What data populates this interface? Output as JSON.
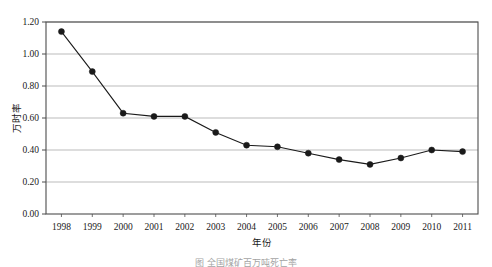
{
  "chart_data": {
    "type": "line",
    "title": "",
    "xlabel": "年份",
    "ylabel": "万时率",
    "categories": [
      "1998",
      "1999",
      "2000",
      "2001",
      "2002",
      "2003",
      "2004",
      "2005",
      "2006",
      "2007",
      "2008",
      "2009",
      "2010",
      "2011"
    ],
    "values": [
      1.14,
      0.89,
      0.63,
      0.61,
      0.61,
      0.51,
      0.43,
      0.42,
      0.38,
      0.34,
      0.31,
      0.35,
      0.4,
      0.39
    ],
    "ylim": [
      0.0,
      1.2
    ],
    "ytick_labels": [
      "0.00",
      "0.20",
      "0.40",
      "0.60",
      "0.80",
      "1.00",
      "1.20"
    ],
    "ytick_values": [
      0.0,
      0.2,
      0.4,
      0.6,
      0.8,
      1.0,
      1.2
    ],
    "grid": true,
    "legend": null,
    "marker": "filled-circle",
    "series_color": "#1a1a1a",
    "grid_color": "#b3b3b3"
  },
  "caption": {
    "text": "图    全国煤矿百万吨死亡率"
  }
}
